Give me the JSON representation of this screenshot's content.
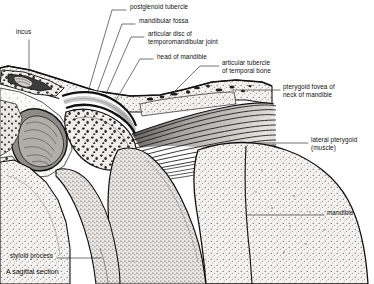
{
  "figure": {
    "caption": "A sagittal section",
    "signature": "s.r.",
    "colors": {
      "ink": "#111111",
      "leader": "#2a2a2a",
      "bone_fill": "#f1f0ee",
      "bone_stipple": "#5f5c58",
      "cortical": "#161616",
      "disc_fill": "#b9b9b9",
      "muscle_fill": "#cfcdc8",
      "muscle_stripe": "#1b1b1b",
      "marrow_dark": "#2b2b2b",
      "background": "#ffffff"
    }
  },
  "labels": [
    {
      "id": "incus",
      "text": "incus",
      "x": 16,
      "y": 31,
      "align": "left",
      "leader": [
        [
          29,
          40
        ],
        [
          29,
          72
        ]
      ]
    },
    {
      "id": "postglenoid-tubercle",
      "text": "postglenoid tubercle",
      "x": 130,
      "y": 6,
      "align": "left",
      "leader": [
        [
          126,
          10
        ],
        [
          112,
          10
        ],
        [
          88,
          92
        ]
      ]
    },
    {
      "id": "mandibular-fossa",
      "text": "mandibular fossa",
      "x": 139,
      "y": 20,
      "align": "left",
      "leader": [
        [
          135,
          24
        ],
        [
          122,
          24
        ],
        [
          97,
          92
        ]
      ]
    },
    {
      "id": "articular-disc",
      "text": "articular disc of\ntemporomandibular joint",
      "x": 148,
      "y": 33,
      "align": "left",
      "leader": [
        [
          144,
          37
        ],
        [
          131,
          37
        ],
        [
          106,
          94
        ]
      ]
    },
    {
      "id": "head-of-mandible",
      "text": "head of mandible",
      "x": 157,
      "y": 56,
      "align": "left",
      "leader": [
        [
          153,
          59
        ],
        [
          140,
          59
        ],
        [
          116,
          100
        ]
      ]
    },
    {
      "id": "articular-tubercle",
      "text": "articular tubercle\nof temporal bone",
      "x": 222,
      "y": 62,
      "align": "left",
      "leader": [
        [
          219,
          66
        ],
        [
          200,
          66
        ],
        [
          170,
          96
        ]
      ]
    },
    {
      "id": "pterygoid-fovea",
      "text": "pterygoid fovea of\nneck of mandible",
      "x": 283,
      "y": 86,
      "align": "left",
      "leader": [
        [
          280,
          90
        ],
        [
          232,
          90
        ]
      ]
    },
    {
      "id": "lateral-pterygoid",
      "text": "lateral pterygoid\n(muscle)",
      "x": 311,
      "y": 139,
      "align": "left",
      "leader": [
        [
          308,
          143
        ],
        [
          258,
          143
        ]
      ]
    },
    {
      "id": "mandible",
      "text": "mandible",
      "x": 327,
      "y": 212,
      "align": "left",
      "leader": [
        [
          324,
          215
        ],
        [
          247,
          215
        ]
      ]
    },
    {
      "id": "styloid-process",
      "text": "styloid process",
      "x": 10,
      "y": 255,
      "align": "left",
      "leader": [
        [
          57,
          258
        ],
        [
          101,
          258
        ]
      ]
    }
  ],
  "structures": [
    {
      "id": "temporal-bone",
      "name": "temporal bone"
    },
    {
      "id": "middle-ear-cavity",
      "name": "middle ear cavity with incus"
    },
    {
      "id": "external-acoustic-meatus",
      "name": "external acoustic meatus"
    },
    {
      "id": "mandibular-fossa-region",
      "name": "mandibular fossa"
    },
    {
      "id": "articular-disc-region",
      "name": "articular disc"
    },
    {
      "id": "mandibular-condyle",
      "name": "head of mandible"
    },
    {
      "id": "articular-tubercle-region",
      "name": "articular tubercle"
    },
    {
      "id": "lateral-pterygoid-muscle",
      "name": "lateral pterygoid muscle"
    },
    {
      "id": "mandibular-ramus",
      "name": "ramus of mandible"
    },
    {
      "id": "styloid-process-region",
      "name": "styloid process"
    }
  ]
}
